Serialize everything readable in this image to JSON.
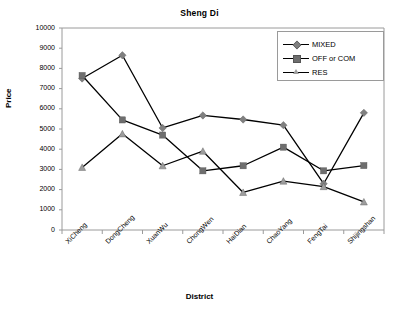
{
  "chart_data": {
    "type": "line",
    "title": "Sheng Di",
    "xlabel": "District",
    "ylabel": "Price",
    "categories": [
      "XiCheng",
      "DongCheng",
      "XuanWu",
      "ChongWen",
      "HaiDian",
      "ChaoYang",
      "FengTai",
      "Shijingshan"
    ],
    "ylim": [
      0,
      10000
    ],
    "yticks": [
      "0",
      "1000",
      "2000",
      "3000",
      "4000",
      "5000",
      "6000",
      "7000",
      "8000",
      "9000",
      "10000"
    ],
    "ytick_values": [
      0,
      1000,
      2000,
      3000,
      4000,
      5000,
      6000,
      7000,
      8000,
      9000,
      10000
    ],
    "grid": false,
    "legend_position": "top-right",
    "series": [
      {
        "name": "MIXED",
        "marker": "diamond",
        "color": "#808080",
        "line_color": "#000000",
        "values": [
          7500,
          8650,
          5050,
          5670,
          5470,
          5190,
          2290,
          5800
        ]
      },
      {
        "name": "OFF or COM",
        "marker": "square",
        "color": "#6e6e6e",
        "line_color": "#000000",
        "values": [
          7650,
          5450,
          4700,
          2930,
          3180,
          4100,
          2930,
          3190
        ]
      },
      {
        "name": "RES",
        "marker": "triangle",
        "color": "#9d9d9d",
        "line_color": "#000000",
        "values": [
          3100,
          4760,
          3180,
          3900,
          1860,
          2420,
          2150,
          1390
        ]
      }
    ]
  },
  "colors": {
    "axis": "#9a9a9a",
    "text": "#000000",
    "background": "#ffffff"
  }
}
